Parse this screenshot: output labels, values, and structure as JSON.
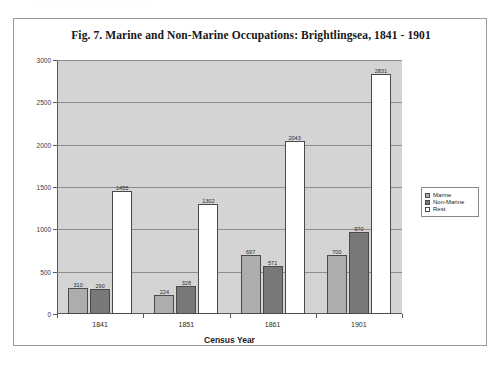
{
  "scan_remnant": "· · ·   ·  ·   ·· ·    ·· ·          ··        ·",
  "figure": {
    "title": "Fig. 7. Marine and Non-Marine Occupations: Brightlingsea, 1841 - 1901"
  },
  "legend": {
    "items": [
      {
        "label": "Marine",
        "swatch": "marine",
        "color": "#adadad"
      },
      {
        "label": "Non-Marine",
        "swatch": "nonmarine",
        "color": "#787878"
      },
      {
        "label": "Rest",
        "swatch": "rest",
        "color": "#ffffff"
      }
    ]
  },
  "chart_data": {
    "type": "bar",
    "title": "Fig. 7. Marine and Non-Marine Occupations: Brightlingsea, 1841 - 1901",
    "xlabel": "Census Year",
    "ylabel": "",
    "categories": [
      "1841",
      "1851",
      "1861",
      "1901"
    ],
    "series": [
      {
        "name": "Marine",
        "color": "#adadad",
        "values": [
          310,
          224,
          697,
          700
        ]
      },
      {
        "name": "Non-Marine",
        "color": "#787878",
        "values": [
          290,
          328,
          571,
          970
        ]
      },
      {
        "name": "Rest",
        "color": "#ffffff",
        "values": [
          1455,
          1302,
          2043,
          2831
        ]
      }
    ],
    "ylim": [
      0,
      3000
    ],
    "yticks": [
      0,
      500,
      1000,
      1500,
      2000,
      2500,
      3000
    ],
    "ytick_labels": [
      "0",
      "500",
      "1000",
      "1500",
      "2000",
      "2500",
      "3000"
    ],
    "grid": true,
    "legend_position": "right",
    "plot_background": "#d4d4d4"
  }
}
